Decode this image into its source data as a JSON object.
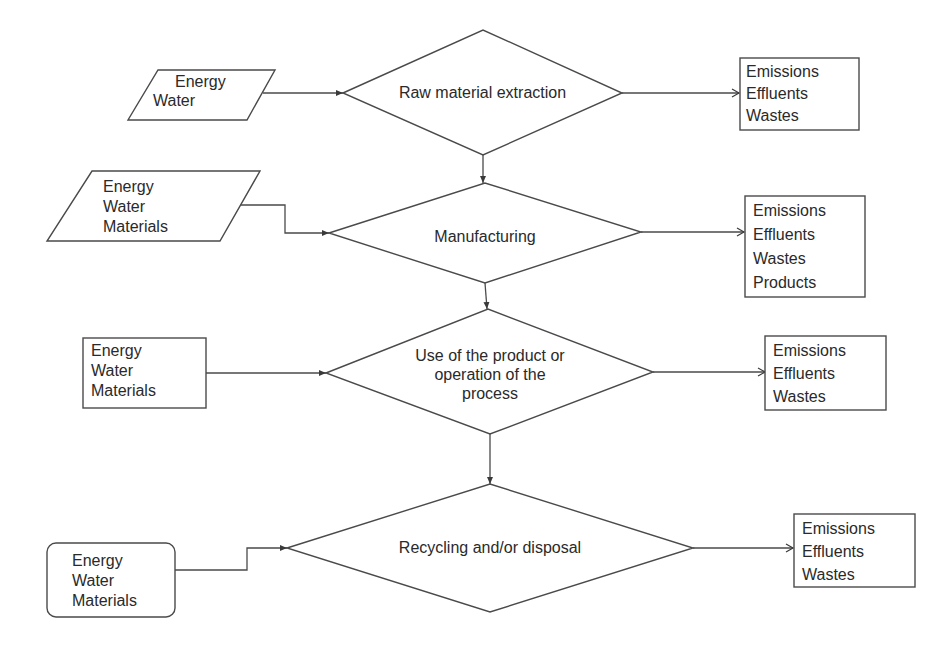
{
  "diagram": {
    "stages": [
      {
        "id": "raw",
        "label": "Raw material extraction",
        "inputs": [
          "Energy",
          "Water"
        ],
        "input_shape": "parallelogram",
        "outputs": [
          "Emissions",
          "Effluents",
          "Wastes"
        ]
      },
      {
        "id": "manufacturing",
        "label": "Manufacturing",
        "inputs": [
          "Energy",
          "Water",
          "Materials"
        ],
        "input_shape": "parallelogram",
        "outputs": [
          "Emissions",
          "Effluents",
          "Wastes",
          "Products"
        ]
      },
      {
        "id": "use",
        "label_lines": [
          "Use of the product or",
          "operation of the",
          "process"
        ],
        "inputs": [
          "Energy",
          "Water",
          "Materials"
        ],
        "input_shape": "rectangle",
        "outputs": [
          "Emissions",
          "Effluents",
          "Wastes"
        ]
      },
      {
        "id": "recycling",
        "label": "Recycling and/or disposal",
        "inputs": [
          "Energy",
          "Water",
          "Materials"
        ],
        "input_shape": "rounded-rectangle",
        "outputs": [
          "Emissions",
          "Effluents",
          "Wastes"
        ]
      }
    ],
    "colors": {
      "stroke": "#4a4a4a",
      "text": "#2a2a2a",
      "background": "#ffffff"
    }
  }
}
